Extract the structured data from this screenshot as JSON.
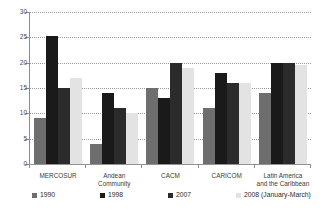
{
  "chart_data": {
    "type": "bar",
    "title": "",
    "subtitle": "",
    "xlabel": "",
    "ylabel": "",
    "ylim": [
      0,
      30
    ],
    "yticks": [
      0,
      5,
      10,
      15,
      20,
      25,
      30
    ],
    "ytick_labels": [
      "0",
      "5",
      "10",
      "15",
      "20",
      "25",
      "30"
    ],
    "grid": true,
    "legend_position": "bottom",
    "categories": [
      "MERCOSUR",
      "Andean\nCommunity",
      "CACM",
      "CARICOM",
      "Latin America\nand the Caribbean"
    ],
    "category_lines": [
      [
        "MERCOSUR"
      ],
      [
        "Andean",
        "Community"
      ],
      [
        "CACM"
      ],
      [
        "CARICOM"
      ],
      [
        "Latin America",
        "and the Caribbean"
      ]
    ],
    "series": [
      {
        "name": "1990",
        "color": "#6e6e6e",
        "values": [
          9,
          4,
          15,
          11,
          14
        ]
      },
      {
        "name": "1998",
        "color": "#1a1a1a",
        "values": [
          25.2,
          14,
          13,
          18,
          20
        ]
      },
      {
        "name": "2007",
        "color": "#2b2b2b",
        "values": [
          15,
          11,
          20,
          16,
          20
        ]
      },
      {
        "name": "2008 (January-March)",
        "color": "#e3e3e3",
        "values": [
          17,
          10,
          19,
          16,
          19.5
        ]
      }
    ]
  },
  "legend": {
    "items": [
      {
        "label": "1990",
        "color": "#6e6e6e"
      },
      {
        "label": "1998",
        "color": "#1a1a1a"
      },
      {
        "label": "2007",
        "color": "#2b2b2b"
      },
      {
        "label": "2008 (January-March)",
        "color": "#e3e3e3"
      }
    ]
  },
  "axis": {
    "y_tick_labels": [
      "30",
      "25",
      "20",
      "15",
      "10",
      "5",
      "0"
    ]
  }
}
